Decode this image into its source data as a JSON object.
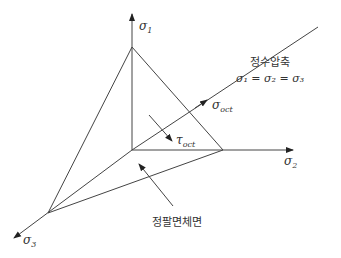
{
  "diagram": {
    "axes": {
      "sigma1": {
        "symbol": "σ",
        "sub": "1"
      },
      "sigma2": {
        "symbol": "σ",
        "sub": "2"
      },
      "sigma3": {
        "symbol": "σ",
        "sub": "3"
      }
    },
    "hydrostatic_axis": {
      "label": "정수압축",
      "equation": "σ₁ = σ₂ = σ₃"
    },
    "sigma_oct": {
      "symbol": "σ",
      "sub": "oct"
    },
    "tau_oct": {
      "symbol": "τ",
      "sub": "oct"
    },
    "octahedral_plane_label": "정팔면체면",
    "colors": {
      "line": "#444444",
      "text": "#333333",
      "background": "#ffffff"
    }
  }
}
